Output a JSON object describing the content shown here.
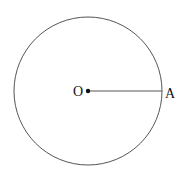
{
  "diagram": {
    "type": "circle-radius",
    "center_label": "O",
    "point_label": "A",
    "center": [
      88,
      91
    ],
    "radius": 74,
    "stroke_color": "#555555",
    "point_color": "#111111"
  }
}
